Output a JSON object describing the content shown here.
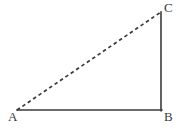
{
  "figure": {
    "name": "right-triangle-with-dashed-hypotenuse",
    "background_color": "#ffffff",
    "stroke_color": "#3a3a3a",
    "width": 180,
    "height": 129
  },
  "vertices": {
    "A": {
      "label": "A",
      "x": 17,
      "y": 110
    },
    "B": {
      "label": "B",
      "x": 161,
      "y": 110
    },
    "C": {
      "label": "C",
      "x": 161,
      "y": 12
    }
  },
  "edges": {
    "base": {
      "name": "segment-AB",
      "style": "solid",
      "from": "A",
      "to": "B",
      "width": 1.6,
      "color": "#3a3a3a"
    },
    "vertical": {
      "name": "segment-BC",
      "style": "solid",
      "from": "B",
      "to": "C",
      "width": 1.6,
      "color": "#3a3a3a"
    },
    "hypotenuse": {
      "name": "segment-AC",
      "style": "dashed",
      "from": "A",
      "to": "C",
      "width": 1.7,
      "color": "#3a3a3a",
      "dash_pattern": "3.5 3"
    }
  }
}
